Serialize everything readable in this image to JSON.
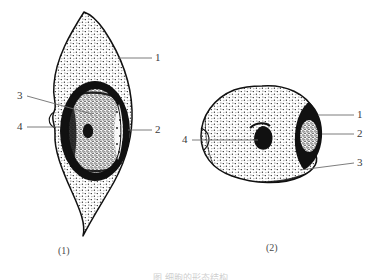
{
  "diagram": {
    "title_caption": "",
    "bottom_caption_clipped": "图  细胞的形态结构",
    "figures": [
      {
        "id": "figure-1",
        "caption": "(1)",
        "shape": "spindle-shaped cell with pointed ends",
        "labels": [
          {
            "number": "1",
            "side": "right",
            "x": 155,
            "y": 58
          },
          {
            "number": "2",
            "side": "right",
            "x": 155,
            "y": 130
          },
          {
            "number": "3",
            "side": "left",
            "x": 18,
            "y": 96
          },
          {
            "number": "4",
            "side": "left",
            "x": 18,
            "y": 127
          }
        ]
      },
      {
        "id": "figure-2",
        "caption": "(2)",
        "shape": "oval cell with lateral dark lobe",
        "labels": [
          {
            "number": "1",
            "side": "right",
            "x": 357,
            "y": 115
          },
          {
            "number": "2",
            "side": "right",
            "x": 357,
            "y": 134
          },
          {
            "number": "3",
            "side": "right",
            "x": 357,
            "y": 163
          },
          {
            "number": "4",
            "side": "left",
            "x": 183,
            "y": 140
          }
        ]
      }
    ]
  }
}
